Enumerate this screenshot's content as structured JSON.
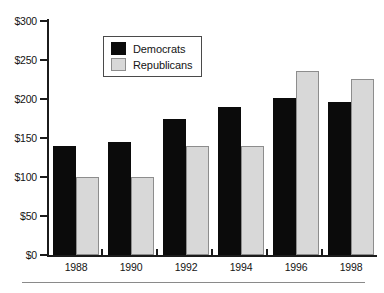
{
  "chart_data": {
    "type": "bar",
    "title": "",
    "xlabel": "",
    "ylabel": "",
    "categories": [
      "1988",
      "1990",
      "1992",
      "1994",
      "1996",
      "1998"
    ],
    "series": [
      {
        "name": "Democrats",
        "color": "#0b0b0b",
        "values": [
          140,
          145,
          175,
          190,
          201,
          196
        ]
      },
      {
        "name": "Republicans",
        "color": "#d8d8d8",
        "values": [
          100,
          100,
          140,
          140,
          236,
          226
        ]
      }
    ],
    "ylim": [
      0,
      300
    ],
    "yticks": [
      0,
      50,
      100,
      150,
      200,
      250,
      300
    ],
    "ytick_labels": [
      "$0",
      "$50",
      "$100",
      "$150",
      "$200",
      "$250",
      "$300"
    ],
    "grid": false,
    "legend_position": "top-left-inside"
  },
  "legend": {
    "items": [
      {
        "label": "Democrats"
      },
      {
        "label": "Republicans"
      }
    ]
  },
  "footer": {
    "caption": ""
  }
}
